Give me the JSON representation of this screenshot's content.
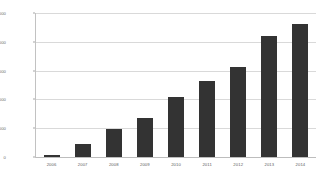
{
  "chart_data": {
    "type": "bar",
    "title": "",
    "xlabel": "",
    "ylabel": "",
    "categories": [
      "2006",
      "2007",
      "2008",
      "2009",
      "2010",
      "2011",
      "2012",
      "2013",
      "2014"
    ],
    "values": [
      60,
      450,
      960,
      1350,
      2080,
      2650,
      3120,
      4200,
      4620
    ],
    "series": [
      {
        "name": "",
        "values": [
          60,
          450,
          960,
          1350,
          2080,
          2650,
          3120,
          4200,
          4620
        ]
      }
    ],
    "ylim": [
      0,
      5000
    ],
    "y_ticks": [
      0,
      1000,
      2000,
      3000,
      4000,
      5000
    ],
    "y_tick_labels": [
      "0",
      "1000",
      "2000",
      "3000",
      "4000",
      "5000"
    ],
    "grid": true,
    "legend": false,
    "legend_position": "none",
    "bar_color": "#333333",
    "gridline_color": "#d9d9d9",
    "axis_color": "#c2c2c2",
    "tick_label_color": "#6b6b6b",
    "background_color": "#ffffff"
  }
}
